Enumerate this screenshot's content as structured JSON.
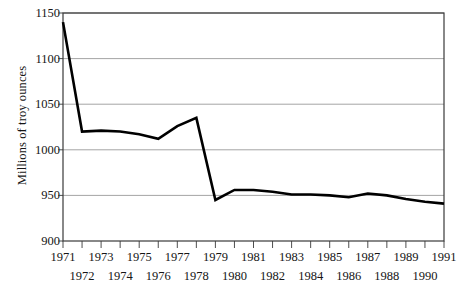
{
  "chart_data": {
    "type": "line",
    "title": "",
    "xlabel": "",
    "ylabel": "Millions of troy ounces",
    "x": [
      1971,
      1972,
      1973,
      1974,
      1975,
      1976,
      1977,
      1978,
      1979,
      1980,
      1981,
      1982,
      1983,
      1984,
      1985,
      1986,
      1987,
      1988,
      1989,
      1990,
      1991
    ],
    "values": [
      1140,
      1020,
      1021,
      1020,
      1017,
      1012,
      1026,
      1035,
      945,
      956,
      956,
      954,
      951,
      951,
      950,
      948,
      952,
      950,
      946,
      943,
      941
    ],
    "categories": [
      "1971",
      "1972",
      "1973",
      "1974",
      "1975",
      "1976",
      "1977",
      "1978",
      "1979",
      "1980",
      "1981",
      "1982",
      "1983",
      "1984",
      "1985",
      "1986",
      "1987",
      "1988",
      "1989",
      "1990",
      "1991"
    ],
    "xlim": [
      1971,
      1991
    ],
    "ylim": [
      900,
      1150
    ],
    "ytick_values": [
      900,
      950,
      1000,
      1050,
      1100,
      1150
    ],
    "ytick_labels": [
      "900",
      "950",
      "1000",
      "1050",
      "1100",
      "1150"
    ],
    "xtick_labels_row0": [
      "1971",
      "1973",
      "1975",
      "1977",
      "1979",
      "1981",
      "1983",
      "1985",
      "1987",
      "1989",
      "1991"
    ],
    "xtick_labels_row1": [
      "1972",
      "1974",
      "1976",
      "1978",
      "1980",
      "1982",
      "1984",
      "1986",
      "1988",
      "1990"
    ],
    "grid": "horizontal",
    "legend": "none",
    "series_color": "#000000",
    "grid_color": "#9a9a9a",
    "frame_color": "#3a3a3a",
    "background": "#ffffff"
  },
  "axis": {
    "ylabel": "Millions of troy ounces"
  }
}
